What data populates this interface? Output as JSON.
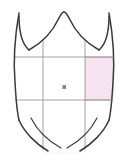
{
  "figure": {
    "caption": "left lumbar region",
    "background_color": "#ffffff",
    "outline_color": "#3a3a3a",
    "grid_color": "#8c8c8c",
    "highlight_color": "#f7e2f0",
    "highlight_border_color": "#9a9a9a",
    "marker_color": "#3c3c3c"
  },
  "regions": {
    "count": 9,
    "highlighted": "left lumbar",
    "labels": [
      "right hypochondriac",
      "epigastric",
      "left hypochondriac",
      "right lumbar",
      "umbilical",
      "left lumbar",
      "right iliac",
      "hypogastric",
      "left iliac"
    ]
  },
  "grid": {
    "vertical_lines": [
      43,
      85
    ],
    "horizontal_lines": [
      57,
      100
    ]
  },
  "marker": {
    "name": "umbilicus-marker",
    "x": 64,
    "y": 87,
    "symbol": "x"
  }
}
